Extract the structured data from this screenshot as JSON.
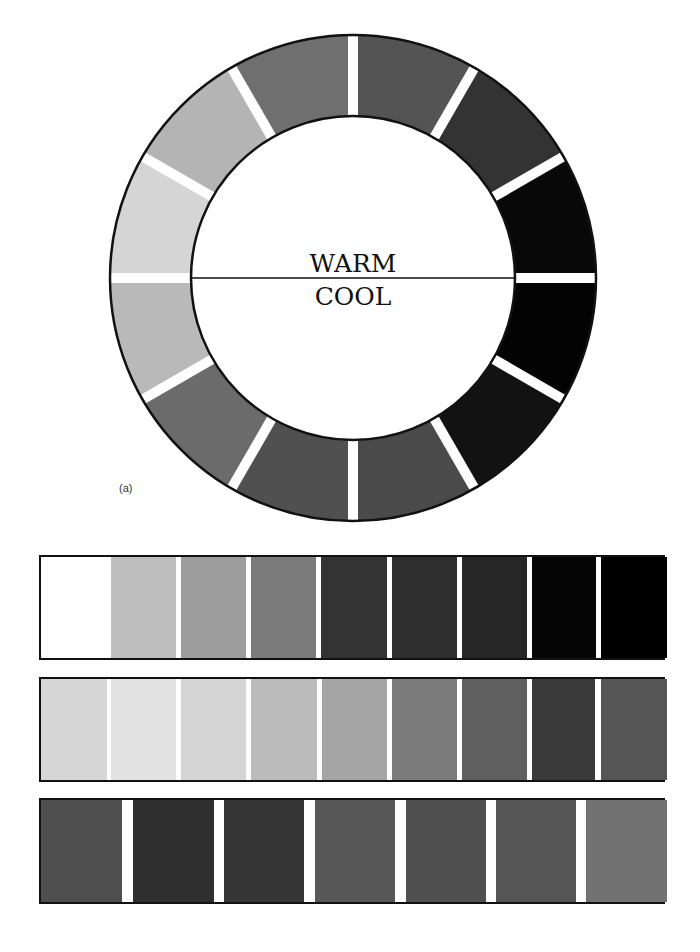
{
  "wheel": {
    "center": [
      353,
      278
    ],
    "outer_radius": 243,
    "inner_radius": 162,
    "separator_color": "#ffffff",
    "labels": {
      "warm": "WARM",
      "cool": "COOL"
    },
    "segments": [
      {
        "start_deg": 0,
        "end_deg": 30,
        "color": "#545454"
      },
      {
        "start_deg": 30,
        "end_deg": 60,
        "color": "#333333"
      },
      {
        "start_deg": 60,
        "end_deg": 90,
        "color": "#080808"
      },
      {
        "start_deg": 90,
        "end_deg": 120,
        "color": "#030303"
      },
      {
        "start_deg": 120,
        "end_deg": 150,
        "color": "#121212"
      },
      {
        "start_deg": 150,
        "end_deg": 180,
        "color": "#4a4a4a"
      },
      {
        "start_deg": 180,
        "end_deg": 210,
        "color": "#505050"
      },
      {
        "start_deg": 210,
        "end_deg": 240,
        "color": "#6b6b6b"
      },
      {
        "start_deg": 240,
        "end_deg": 270,
        "color": "#b9b9b9"
      },
      {
        "start_deg": 270,
        "end_deg": 300,
        "color": "#d5d5d5"
      },
      {
        "start_deg": 300,
        "end_deg": 330,
        "color": "#b4b4b4"
      },
      {
        "start_deg": 330,
        "end_deg": 360,
        "color": "#6f6f6f"
      }
    ]
  },
  "panel_label": "(a)",
  "bars": [
    {
      "top": 555,
      "height": 105,
      "swatches": [
        {
          "x": 0,
          "w": 70,
          "color": "#ffffff"
        },
        {
          "x": 70,
          "w": 65,
          "color": "#bdbdbd"
        },
        {
          "x": 140,
          "w": 65,
          "color": "#9d9d9d"
        },
        {
          "x": 210,
          "w": 65,
          "color": "#7b7b7b"
        },
        {
          "x": 280,
          "w": 66,
          "color": "#333333"
        },
        {
          "x": 351,
          "w": 65,
          "color": "#2e2e2e"
        },
        {
          "x": 421,
          "w": 65,
          "color": "#262626"
        },
        {
          "x": 491,
          "w": 64,
          "color": "#050505"
        },
        {
          "x": 560,
          "w": 66,
          "color": "#000000"
        }
      ]
    },
    {
      "top": 677,
      "height": 105,
      "swatches": [
        {
          "x": 0,
          "w": 66,
          "color": "#d6d6d6"
        },
        {
          "x": 70,
          "w": 65,
          "color": "#e2e2e2"
        },
        {
          "x": 140,
          "w": 65,
          "color": "#d4d4d4"
        },
        {
          "x": 210,
          "w": 66,
          "color": "#bbbbbb"
        },
        {
          "x": 281,
          "w": 65,
          "color": "#a5a5a5"
        },
        {
          "x": 351,
          "w": 65,
          "color": "#7b7b7b"
        },
        {
          "x": 421,
          "w": 65,
          "color": "#5f5f5f"
        },
        {
          "x": 491,
          "w": 63,
          "color": "#3a3a3a"
        },
        {
          "x": 560,
          "w": 66,
          "color": "#555555"
        }
      ]
    },
    {
      "top": 798,
      "height": 106,
      "swatches": [
        {
          "x": 0,
          "w": 81,
          "color": "#4f4f4f"
        },
        {
          "x": 92,
          "w": 81,
          "color": "#2f2f2f"
        },
        {
          "x": 183,
          "w": 80,
          "color": "#363636"
        },
        {
          "x": 274,
          "w": 80,
          "color": "#585858"
        },
        {
          "x": 365,
          "w": 80,
          "color": "#505050"
        },
        {
          "x": 455,
          "w": 80,
          "color": "#555555"
        },
        {
          "x": 545,
          "w": 81,
          "color": "#727272"
        }
      ]
    }
  ]
}
